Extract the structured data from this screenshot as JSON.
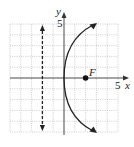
{
  "diagram": {
    "type": "parabola-graph",
    "equation": "y^2 = 8x",
    "vertex": [
      0,
      0
    ],
    "focus": {
      "label": "F",
      "point": [
        2,
        0
      ]
    },
    "directrix": {
      "x": -2,
      "style": "dashed"
    },
    "axes": {
      "x_label": "x",
      "y_label": "y",
      "x_tick_label": "5",
      "y_tick_label": "5",
      "range": [
        -5,
        5
      ]
    },
    "grid": {
      "on": true,
      "step": 1,
      "style": "dotted"
    },
    "colors": {
      "curve": "#222222",
      "grid": "#b0b0b0",
      "axis": "#333333"
    }
  }
}
